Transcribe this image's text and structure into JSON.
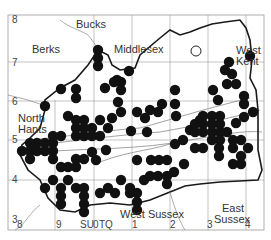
{
  "map": {
    "frame": {
      "x": 8,
      "y": 15,
      "w": 256,
      "h": 215
    },
    "region_labels": [
      {
        "text": "Bucks",
        "x": 76,
        "y": 19
      },
      {
        "text": "Berks",
        "x": 32,
        "y": 44
      },
      {
        "text": "Middlesex",
        "x": 114,
        "y": 44
      },
      {
        "text": "West",
        "x": 236,
        "y": 45
      },
      {
        "text": "Kent",
        "x": 236,
        "y": 56
      },
      {
        "text": "North",
        "x": 18,
        "y": 113
      },
      {
        "text": "Hants",
        "x": 18,
        "y": 124
      },
      {
        "text": "West Sussex",
        "x": 120,
        "y": 209
      },
      {
        "text": "East",
        "x": 222,
        "y": 203
      },
      {
        "text": "Sussex",
        "x": 214,
        "y": 214
      }
    ],
    "y_ticks": [
      {
        "label": "8",
        "y": 20
      },
      {
        "label": "7",
        "y": 63
      },
      {
        "label": "6",
        "y": 102
      },
      {
        "label": "5",
        "y": 140
      },
      {
        "label": "4",
        "y": 180
      },
      {
        "label": "3",
        "y": 220
      }
    ],
    "x_ticks": [
      {
        "label": "8",
        "x": 17
      },
      {
        "label": "9",
        "x": 56
      },
      {
        "label": "SU",
        "x": 80
      },
      {
        "label": "0",
        "x": 93
      },
      {
        "label": "TQ",
        "x": 99
      },
      {
        "label": "1",
        "x": 132
      },
      {
        "label": "2",
        "x": 170
      },
      {
        "label": "3",
        "x": 207
      },
      {
        "label": "4",
        "x": 245
      }
    ],
    "open_circle": {
      "x": 196,
      "y": 51
    },
    "dots": [
      [
        98,
        50
      ],
      [
        98,
        58
      ],
      [
        98,
        66
      ],
      [
        129,
        71
      ],
      [
        121,
        82
      ],
      [
        117,
        80
      ],
      [
        121,
        90
      ],
      [
        105,
        88
      ],
      [
        114,
        82
      ],
      [
        61,
        89
      ],
      [
        76,
        89
      ],
      [
        76,
        98
      ],
      [
        45,
        106
      ],
      [
        68,
        116
      ],
      [
        76,
        120
      ],
      [
        84,
        120
      ],
      [
        76,
        128
      ],
      [
        84,
        128
      ],
      [
        92,
        128
      ],
      [
        76,
        136
      ],
      [
        84,
        136
      ],
      [
        92,
        136
      ],
      [
        100,
        136
      ],
      [
        108,
        128
      ],
      [
        100,
        120
      ],
      [
        61,
        136
      ],
      [
        53,
        136
      ],
      [
        53,
        143
      ],
      [
        45,
        143
      ],
      [
        37,
        143
      ],
      [
        30,
        143
      ],
      [
        30,
        151
      ],
      [
        22,
        151
      ],
      [
        30,
        159
      ],
      [
        37,
        151
      ],
      [
        45,
        151
      ],
      [
        53,
        151
      ],
      [
        53,
        159
      ],
      [
        61,
        167
      ],
      [
        68,
        167
      ],
      [
        76,
        167
      ],
      [
        76,
        159
      ],
      [
        84,
        159
      ],
      [
        92,
        152
      ],
      [
        96,
        160
      ],
      [
        106,
        150
      ],
      [
        53,
        180
      ],
      [
        68,
        180
      ],
      [
        45,
        188
      ],
      [
        61,
        188
      ],
      [
        61,
        196
      ],
      [
        61,
        204
      ],
      [
        76,
        188
      ],
      [
        84,
        188
      ],
      [
        84,
        196
      ],
      [
        84,
        204
      ],
      [
        84,
        212
      ],
      [
        100,
        193
      ],
      [
        115,
        193
      ],
      [
        130,
        193
      ],
      [
        137,
        193
      ],
      [
        137,
        202
      ],
      [
        137,
        210
      ],
      [
        108,
        188
      ],
      [
        121,
        180
      ],
      [
        130,
        188
      ],
      [
        144,
        180
      ],
      [
        137,
        160
      ],
      [
        151,
        160
      ],
      [
        159,
        160
      ],
      [
        167,
        160
      ],
      [
        150,
        176
      ],
      [
        158,
        176
      ],
      [
        167,
        176
      ],
      [
        167,
        184
      ],
      [
        174,
        172
      ],
      [
        184,
        164
      ],
      [
        175,
        144
      ],
      [
        183,
        140
      ],
      [
        190,
        130
      ],
      [
        195,
        124
      ],
      [
        203,
        116
      ],
      [
        212,
        116
      ],
      [
        220,
        116
      ],
      [
        220,
        124
      ],
      [
        212,
        124
      ],
      [
        203,
        124
      ],
      [
        195,
        132
      ],
      [
        203,
        132
      ],
      [
        212,
        132
      ],
      [
        220,
        132
      ],
      [
        227,
        132
      ],
      [
        220,
        140
      ],
      [
        212,
        140
      ],
      [
        203,
        148
      ],
      [
        195,
        148
      ],
      [
        219,
        148
      ],
      [
        219,
        156
      ],
      [
        233,
        140
      ],
      [
        241,
        140
      ],
      [
        233,
        148
      ],
      [
        248,
        148
      ],
      [
        241,
        156
      ],
      [
        233,
        164
      ],
      [
        241,
        164
      ],
      [
        244,
        96
      ],
      [
        244,
        104
      ],
      [
        253,
        112
      ],
      [
        244,
        117
      ],
      [
        236,
        123
      ],
      [
        218,
        100
      ],
      [
        227,
        84
      ],
      [
        236,
        84
      ],
      [
        229,
        62
      ],
      [
        232,
        74
      ],
      [
        200,
        120
      ],
      [
        250,
        56
      ],
      [
        225,
        70
      ],
      [
        213,
        90
      ],
      [
        175,
        90
      ],
      [
        162,
        104
      ],
      [
        176,
        116
      ],
      [
        175,
        104
      ],
      [
        150,
        110
      ],
      [
        158,
        112
      ],
      [
        118,
        102
      ],
      [
        121,
        112
      ],
      [
        137,
        112
      ],
      [
        112,
        118
      ],
      [
        145,
        118
      ],
      [
        147,
        132
      ],
      [
        131,
        131
      ]
    ],
    "colors": {
      "dot": "#111111",
      "border": "#1a1a1a",
      "grid": "#9a9a9a",
      "river": "#8a8a8a"
    }
  }
}
